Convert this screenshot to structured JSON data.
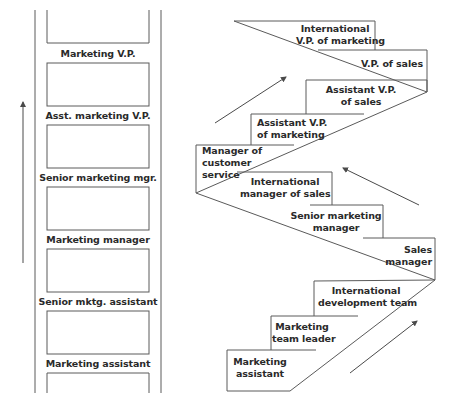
{
  "colors": {
    "line": "#5a5a5a",
    "text": "#2a2a2a",
    "background": "#ffffff"
  },
  "ladder": {
    "direction_arrow": "up-arrow",
    "rungs": [
      {
        "label": "Marketing V.P."
      },
      {
        "label": "Asst. marketing V.P."
      },
      {
        "label": "Senior marketing mgr."
      },
      {
        "label": "Marketing manager"
      },
      {
        "label": "Senior mktg. assistant"
      },
      {
        "label": "Marketing assistant"
      }
    ]
  },
  "staircase": {
    "arrows": [
      "up-right-arrow",
      "up-left-arrow",
      "up-right-arrow"
    ],
    "steps": [
      {
        "line1": "International",
        "line2": "V.P. of marketing"
      },
      {
        "line1": "V.P. of sales"
      },
      {
        "line1": "Assistant V.P.",
        "line2": "of sales"
      },
      {
        "line1": "Assistant V.P.",
        "line2": "of marketing"
      },
      {
        "line1": "Manager of",
        "line2": "customer",
        "line3": "service"
      },
      {
        "line1": "International",
        "line2": "manager of sales"
      },
      {
        "line1": "Senior marketing",
        "line2": "manager"
      },
      {
        "line1": "Sales",
        "line2": "manager"
      },
      {
        "line1": "International",
        "line2": "development team"
      },
      {
        "line1": "Marketing",
        "line2": "team leader"
      },
      {
        "line1": "Marketing",
        "line2": "assistant"
      }
    ]
  }
}
